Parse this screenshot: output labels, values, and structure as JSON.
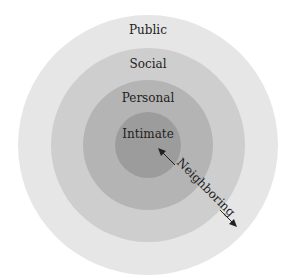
{
  "diagram": {
    "type": "concentric-circles",
    "zones": [
      {
        "label": "Public",
        "color": "#e6e6e6"
      },
      {
        "label": "Social",
        "color": "#cecece"
      },
      {
        "label": "Personal",
        "color": "#b3b3b3"
      },
      {
        "label": "Intimate",
        "color": "#999999"
      }
    ],
    "arrow": {
      "label": "Neighboring"
    }
  }
}
